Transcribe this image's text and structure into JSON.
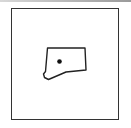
{
  "map": {
    "region": "Connecticut state outline",
    "marker": "location-dot",
    "colors": {
      "outline": "#222222",
      "marker": "#111111",
      "frame": "#333333",
      "background": "#ffffff"
    }
  }
}
